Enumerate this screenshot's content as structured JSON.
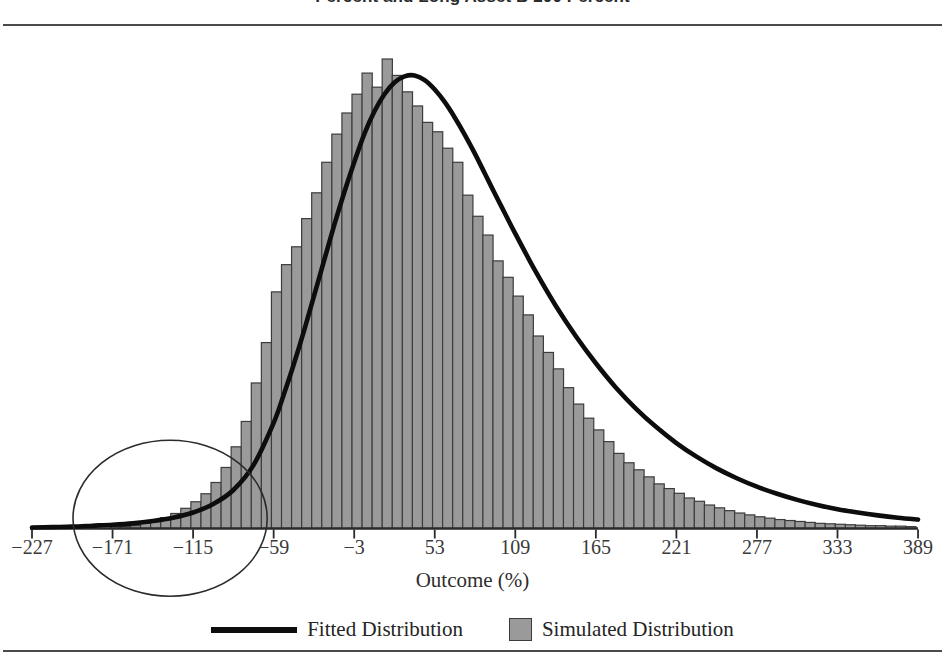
{
  "title": "Percent and Long Asset B 200 Percent",
  "axis": {
    "x_label": "Outcome (%)",
    "x_ticks": [
      -227,
      -171,
      -115,
      -59,
      -3,
      53,
      109,
      165,
      221,
      277,
      333,
      389
    ],
    "x_tick_labels": [
      "−227",
      "−171",
      "−115",
      "−59",
      "−3",
      "53",
      "109",
      "165",
      "221",
      "277",
      "333",
      "389"
    ]
  },
  "legend": {
    "items": [
      {
        "label": "Fitted Distribution",
        "marker": "line",
        "color": "#0d0d0d"
      },
      {
        "label": "Simulated Distribution",
        "marker": "box",
        "color": "#9a9a9a"
      }
    ]
  },
  "annotation": {
    "shape": "ellipse",
    "name": "left-tail-highlight",
    "center_x": -131,
    "center_y_frac": 0.09,
    "width_units": 135,
    "height_px": 156
  },
  "colors": {
    "bar_fill": "#9a9a9a",
    "bar_edge": "#3c3c3c",
    "curve": "#0d0d0d",
    "axis": "#2b2b2b",
    "rule": "#4a4a4a",
    "text": "#242424"
  },
  "chart_data": {
    "type": "bar",
    "title": "Percent and Long Asset B 200 Percent",
    "subtitle": "",
    "xlabel": "Outcome (%)",
    "ylabel": "",
    "xlim": [
      -241,
      403
    ],
    "ylim": [
      0,
      100
    ],
    "grid": false,
    "legend_position": "bottom-center",
    "series": [
      {
        "name": "Simulated Distribution",
        "type": "bar",
        "color": "#9a9a9a",
        "x": [
          -225,
          -218,
          -211,
          -204,
          -197,
          -190,
          -183,
          -176,
          -169,
          -162,
          -155,
          -148,
          -141,
          -134,
          -127,
          -120,
          -113,
          -106,
          -99,
          -92,
          -85,
          -78,
          -71,
          -64,
          -57,
          -50,
          -43,
          -36,
          -29,
          -22,
          -15,
          -8,
          -1,
          6,
          13,
          20,
          27,
          34,
          41,
          48,
          55,
          62,
          69,
          76,
          83,
          90,
          97,
          104,
          111,
          118,
          125,
          132,
          139,
          146,
          153,
          160,
          167,
          174,
          181,
          188,
          195,
          202,
          209,
          216,
          223,
          230,
          237,
          244,
          251,
          258,
          265,
          272,
          279,
          286,
          293,
          300,
          307,
          314,
          321,
          328,
          335,
          342,
          349,
          356,
          363,
          370,
          377,
          384
        ],
        "values": [
          0,
          0,
          0,
          0,
          0,
          0,
          0,
          0,
          0.4,
          0.4,
          0.6,
          1.1,
          1.7,
          2.3,
          3.2,
          4.3,
          5.7,
          7.4,
          9.8,
          13.0,
          17.4,
          22.8,
          31.0,
          39.6,
          50.4,
          56.2,
          60.0,
          66.0,
          71.5,
          78.0,
          84.0,
          88.5,
          92.5,
          97.0,
          94.0,
          100.0,
          96.5,
          93.0,
          90.0,
          86.5,
          84.5,
          81.0,
          78.0,
          71.0,
          66.5,
          62.5,
          57.0,
          53.5,
          49.5,
          45.5,
          41.0,
          37.5,
          34.0,
          30.0,
          26.5,
          23.5,
          21.0,
          18.5,
          16.0,
          14.0,
          12.5,
          11.0,
          9.5,
          8.5,
          7.5,
          6.5,
          5.8,
          5.0,
          4.4,
          3.8,
          3.3,
          2.9,
          2.5,
          2.2,
          1.9,
          1.7,
          1.5,
          1.3,
          1.1,
          1.0,
          0.9,
          0.8,
          0.7,
          0.6,
          0.6,
          0.5,
          0.5,
          0.4
        ]
      },
      {
        "name": "Fitted Distribution",
        "type": "line",
        "color": "#0d0d0d",
        "x": [
          -227,
          -213,
          -199,
          -185,
          -171,
          -157,
          -143,
          -129,
          -115,
          -101,
          -87,
          -73,
          -59,
          -52,
          -45,
          -38,
          -31,
          -24,
          -17,
          -10,
          -3,
          4,
          11,
          18,
          25,
          32,
          39,
          46,
          53,
          60,
          67,
          74,
          81,
          88,
          95,
          102,
          109,
          123,
          137,
          151,
          165,
          179,
          193,
          207,
          221,
          235,
          249,
          263,
          277,
          291,
          305,
          319,
          333,
          347,
          361,
          375,
          389
        ],
        "values": [
          0.2,
          0.3,
          0.4,
          0.6,
          0.8,
          1.1,
          1.6,
          2.3,
          3.4,
          5.2,
          8.2,
          13.5,
          22.5,
          28.5,
          35.0,
          42.0,
          49.5,
          57.0,
          64.5,
          71.5,
          78.0,
          84.0,
          88.8,
          92.5,
          95.0,
          96.3,
          96.5,
          95.5,
          93.5,
          90.8,
          87.5,
          83.8,
          79.8,
          75.5,
          71.2,
          67.0,
          62.8,
          54.8,
          47.5,
          41.0,
          35.2,
          30.0,
          25.5,
          21.6,
          18.2,
          15.3,
          12.8,
          10.7,
          8.9,
          7.4,
          6.1,
          5.0,
          4.1,
          3.4,
          2.8,
          2.3,
          1.9
        ]
      }
    ]
  }
}
